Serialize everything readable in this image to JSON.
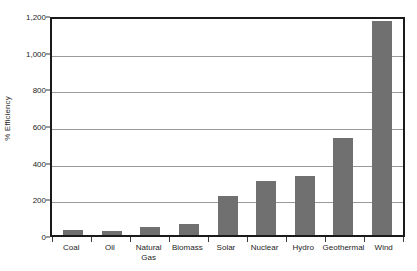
{
  "chart_data": {
    "type": "bar",
    "title": "",
    "xlabel": "",
    "ylabel": "% Efficiency",
    "categories": [
      "Coal",
      "Oil",
      "Natural\nGas",
      "Biomass",
      "Solar",
      "Nuclear",
      "Hydro",
      "Geothermal",
      "Wind"
    ],
    "values": [
      25,
      22,
      45,
      58,
      215,
      295,
      320,
      530,
      1170
    ],
    "ylim": [
      0,
      1200
    ],
    "ytick_values": [
      0,
      200,
      400,
      600,
      800,
      1000,
      1200
    ],
    "ytick_labels": [
      "0",
      "200",
      "400",
      "600",
      "800",
      "1,000",
      "1,200"
    ],
    "grid": true,
    "legend": false,
    "bar_color": "#707070",
    "gridline_color": "#9a9a9a",
    "frame_color": "#1a1a1a",
    "background_color": "#ffffff"
  }
}
